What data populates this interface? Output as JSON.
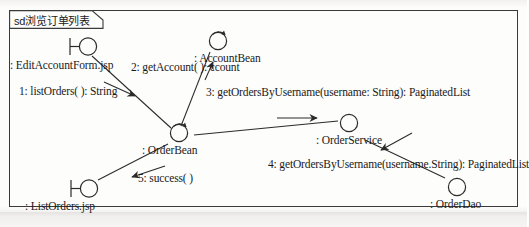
{
  "diagram": {
    "frame_label": "sd浏览订单列表",
    "type": "uml-communication-diagram",
    "stroke_color": "#2b2b2b",
    "background_color": "#fdfdfc"
  },
  "nodes": [
    {
      "id": "edit-account-form",
      "name": "edit-account-form-jsp",
      "label": ": EditAccountForm.jsp",
      "glyph": "boundary-icon"
    },
    {
      "id": "account-bean",
      "name": "account-bean",
      "label": ": AccountBean",
      "glyph": "control-icon"
    },
    {
      "id": "order-bean",
      "name": "order-bean",
      "label": ": OrderBean",
      "glyph": "control-icon"
    },
    {
      "id": "order-service",
      "name": "order-service",
      "label": ": OrderService",
      "glyph": "entity-icon"
    },
    {
      "id": "order-dao",
      "name": "order-dao",
      "label": ": OrderDao",
      "glyph": "entity-icon"
    },
    {
      "id": "list-orders",
      "name": "list-orders-jsp",
      "label": ": ListOrders.jsp",
      "glyph": "boundary-icon"
    }
  ],
  "messages": [
    {
      "id": "m1",
      "name": "message-1-list-orders",
      "label": "1: listOrders( ): String",
      "from": "edit-account-form",
      "to": "order-bean"
    },
    {
      "id": "m2",
      "name": "message-2-get-account",
      "label": "2: getAccount( ): ccount",
      "from": "order-bean",
      "to": "account-bean"
    },
    {
      "id": "m3",
      "name": "message-3-get-orders-by-username",
      "label": "3: getOrdersByUsername(username: String): PaginatedList",
      "from": "order-bean",
      "to": "order-service"
    },
    {
      "id": "m4",
      "name": "message-4-get-orders-by-username",
      "label": "4: getOrdersByUsername(username.String): PaginatedList",
      "from": "order-service",
      "to": "order-dao"
    },
    {
      "id": "m5",
      "name": "message-5-success",
      "label": "5: success( )",
      "from": "order-bean",
      "to": "list-orders"
    }
  ]
}
